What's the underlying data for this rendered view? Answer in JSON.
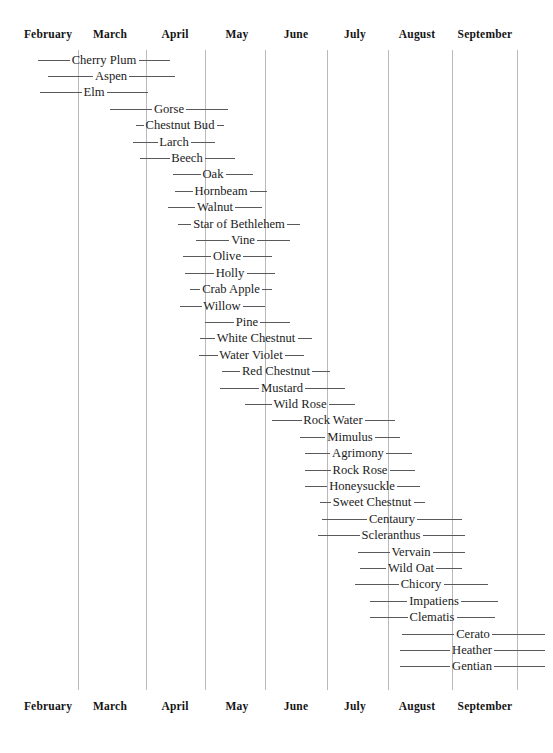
{
  "chart_data": {
    "type": "table",
    "title": "",
    "xlabel": "",
    "ylabel": "",
    "grid": true,
    "legend_position": "none",
    "axis": {
      "top_labels": [
        "February",
        "March",
        "April",
        "May",
        "June",
        "July",
        "August",
        "September"
      ],
      "bottom_labels": [
        "February",
        "March",
        "April",
        "May",
        "June",
        "July",
        "August",
        "September"
      ],
      "tick_positions_px": [
        48,
        110,
        175,
        237,
        296,
        355,
        417,
        485
      ],
      "gridline_positions_px": [
        78,
        146,
        205,
        265,
        327,
        388,
        452,
        517
      ],
      "x_start_px": 18,
      "x_end_px": 545,
      "plot_top_px": 50,
      "plot_bottom_px": 690,
      "row_height_px": 16.4
    },
    "categories": [
      "Cherry Plum",
      "Aspen",
      "Elm",
      "Gorse",
      "Chestnut Bud",
      "Larch",
      "Beech",
      "Oak",
      "Hornbeam",
      "Walnut",
      "Star of Bethlehem",
      "Vine",
      "Olive",
      "Holly",
      "Crab Apple",
      "Willow",
      "Pine",
      "White Chestnut",
      "Water Violet",
      "Red Chestnut",
      "Mustard",
      "Wild Rose",
      "Rock Water",
      "Mimulus",
      "Agrimony",
      "Rock Rose",
      "Honeysuckle",
      "Sweet Chestnut",
      "Centaury",
      "Scleranthus",
      "Vervain",
      "Wild Oat",
      "Chicory",
      "Impatiens",
      "Clematis",
      "Cerato",
      "Heather",
      "Gentian"
    ],
    "rows": [
      {
        "label": "Cherry Plum",
        "start_px": 38,
        "end_px": 170,
        "center_px": 104
      },
      {
        "label": "Aspen",
        "start_px": 48,
        "end_px": 175,
        "center_px": 111
      },
      {
        "label": "Elm",
        "start_px": 40,
        "end_px": 148,
        "center_px": 94
      },
      {
        "label": "Gorse",
        "start_px": 110,
        "end_px": 228,
        "center_px": 169
      },
      {
        "label": "Chestnut Bud",
        "start_px": 136,
        "end_px": 224,
        "center_px": 180
      },
      {
        "label": "Larch",
        "start_px": 133,
        "end_px": 215,
        "center_px": 174
      },
      {
        "label": "Beech",
        "start_px": 140,
        "end_px": 235,
        "center_px": 187
      },
      {
        "label": "Oak",
        "start_px": 173,
        "end_px": 253,
        "center_px": 213
      },
      {
        "label": "Hornbeam",
        "start_px": 175,
        "end_px": 267,
        "center_px": 221
      },
      {
        "label": "Walnut",
        "start_px": 168,
        "end_px": 262,
        "center_px": 215
      },
      {
        "label": "Star of Bethlehem",
        "start_px": 178,
        "end_px": 300,
        "center_px": 239
      },
      {
        "label": "Vine",
        "start_px": 196,
        "end_px": 290,
        "center_px": 243
      },
      {
        "label": "Olive",
        "start_px": 183,
        "end_px": 272,
        "center_px": 227
      },
      {
        "label": "Holly",
        "start_px": 185,
        "end_px": 275,
        "center_px": 230
      },
      {
        "label": "Crab Apple",
        "start_px": 190,
        "end_px": 272,
        "center_px": 231
      },
      {
        "label": "Willow",
        "start_px": 180,
        "end_px": 265,
        "center_px": 222
      },
      {
        "label": "Pine",
        "start_px": 205,
        "end_px": 290,
        "center_px": 247
      },
      {
        "label": "White Chestnut",
        "start_px": 200,
        "end_px": 312,
        "center_px": 256
      },
      {
        "label": "Water Violet",
        "start_px": 199,
        "end_px": 304,
        "center_px": 251
      },
      {
        "label": "Red Chestnut",
        "start_px": 222,
        "end_px": 330,
        "center_px": 276
      },
      {
        "label": "Mustard",
        "start_px": 220,
        "end_px": 345,
        "center_px": 282
      },
      {
        "label": "Wild Rose",
        "start_px": 245,
        "end_px": 355,
        "center_px": 300
      },
      {
        "label": "Rock Water",
        "start_px": 272,
        "end_px": 395,
        "center_px": 333
      },
      {
        "label": "Mimulus",
        "start_px": 300,
        "end_px": 400,
        "center_px": 350
      },
      {
        "label": "Agrimony",
        "start_px": 305,
        "end_px": 412,
        "center_px": 358
      },
      {
        "label": "Rock Rose",
        "start_px": 305,
        "end_px": 415,
        "center_px": 360
      },
      {
        "label": "Honeysuckle",
        "start_px": 305,
        "end_px": 420,
        "center_px": 362
      },
      {
        "label": "Sweet Chestnut",
        "start_px": 320,
        "end_px": 425,
        "center_px": 372
      },
      {
        "label": "Centaury",
        "start_px": 322,
        "end_px": 462,
        "center_px": 392
      },
      {
        "label": "Scleranthus",
        "start_px": 318,
        "end_px": 465,
        "center_px": 391
      },
      {
        "label": "Vervain",
        "start_px": 358,
        "end_px": 465,
        "center_px": 411
      },
      {
        "label": "Wild Oat",
        "start_px": 360,
        "end_px": 462,
        "center_px": 411
      },
      {
        "label": "Chicory",
        "start_px": 355,
        "end_px": 488,
        "center_px": 421
      },
      {
        "label": "Impatiens",
        "start_px": 370,
        "end_px": 498,
        "center_px": 434
      },
      {
        "label": "Clematis",
        "start_px": 370,
        "end_px": 495,
        "center_px": 432
      },
      {
        "label": "Cerato",
        "start_px": 402,
        "end_px": 545,
        "center_px": 473
      },
      {
        "label": "Heather",
        "start_px": 400,
        "end_px": 545,
        "center_px": 472
      },
      {
        "label": "Gentian",
        "start_px": 400,
        "end_px": 545,
        "center_px": 472
      }
    ]
  },
  "colors": {
    "gridline": "#b9b9bb",
    "bar": "#5a5a5e",
    "text": "#1c1c1c",
    "background": "#ffffff"
  }
}
